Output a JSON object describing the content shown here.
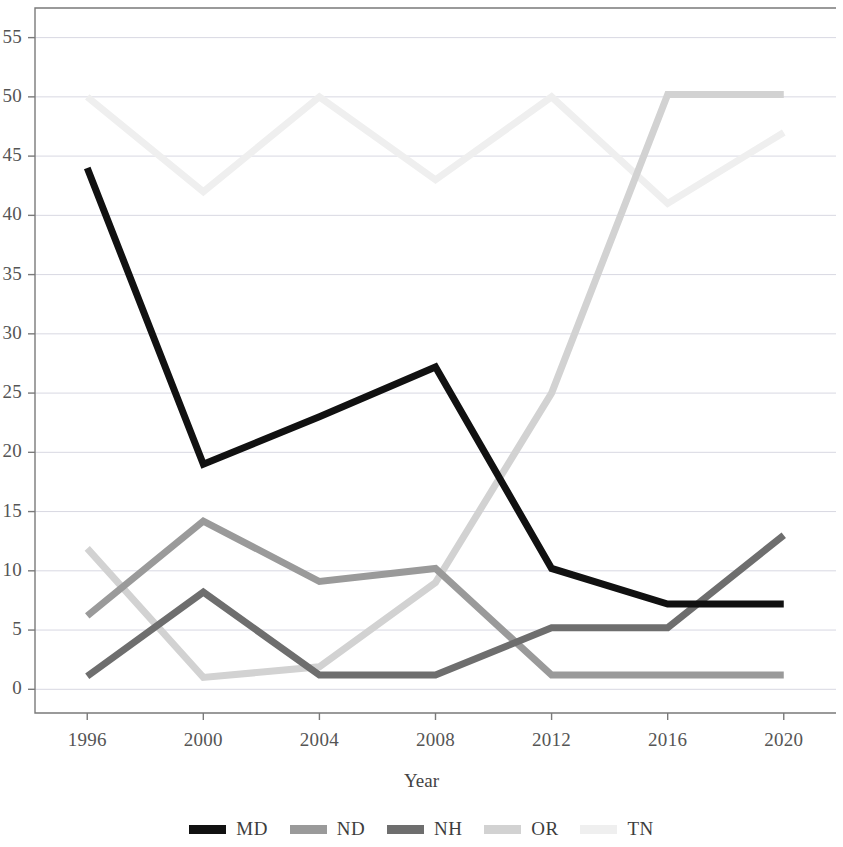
{
  "chart_data": {
    "type": "line",
    "title": "",
    "subtitle": "",
    "xlabel": "Year",
    "ylabel": "",
    "x": [
      1996,
      2000,
      2004,
      2008,
      2012,
      2016,
      2020
    ],
    "xtick_labels": [
      "1996",
      "2000",
      "2004",
      "2008",
      "2012",
      "2016",
      "2020"
    ],
    "ytick_labels": [
      "0",
      "5",
      "10",
      "15",
      "20",
      "25",
      "30",
      "35",
      "40",
      "45",
      "50",
      "55"
    ],
    "yticks": [
      0,
      5,
      10,
      15,
      20,
      25,
      30,
      35,
      40,
      45,
      50,
      55
    ],
    "xlim": [
      1994.2,
      2021.8
    ],
    "ylim": [
      -2.0,
      57.5
    ],
    "grid": true,
    "grid_axis": "y",
    "legend_position": "bottom",
    "series": [
      {
        "name": "MD",
        "color": "#111111",
        "values": [
          44.0,
          19.0,
          23.0,
          27.2,
          10.2,
          7.2,
          7.2
        ]
      },
      {
        "name": "ND",
        "color": "#9a9a9a",
        "values": [
          6.2,
          14.2,
          9.1,
          10.2,
          1.2,
          1.2,
          1.2
        ]
      },
      {
        "name": "NH",
        "color": "#6e6e6e",
        "values": [
          1.1,
          8.2,
          1.2,
          1.2,
          5.2,
          5.2,
          13.0
        ]
      },
      {
        "name": "OR",
        "color": "#d2d2d2",
        "values": [
          11.9,
          1.0,
          1.9,
          9.0,
          25.0,
          50.2,
          50.2
        ]
      },
      {
        "name": "TN",
        "color": "#efefef",
        "values": [
          50.0,
          42.0,
          50.0,
          43.0,
          50.0,
          41.0,
          47.0
        ]
      }
    ]
  },
  "legend": {
    "items": [
      {
        "label": "MD",
        "color": "#111111"
      },
      {
        "label": "ND",
        "color": "#9a9a9a"
      },
      {
        "label": "NH",
        "color": "#6e6e6e"
      },
      {
        "label": "OR",
        "color": "#d2d2d2"
      },
      {
        "label": "TN",
        "color": "#efefef"
      }
    ]
  },
  "axes": {
    "x_title": "Year",
    "frame_color": "#7a7a7a",
    "grid_color": "#d8d8e2"
  }
}
